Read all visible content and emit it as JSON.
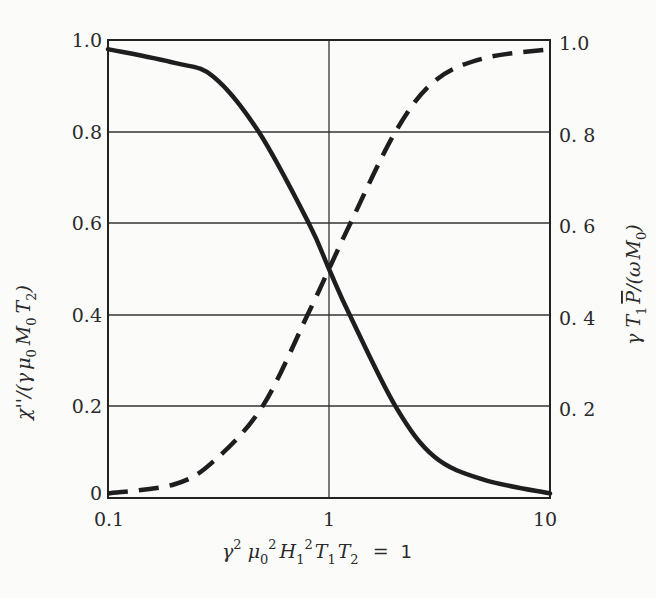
{
  "chart_data": {
    "type": "line",
    "title": "",
    "xscale": "log",
    "xlim": [
      0.1,
      10
    ],
    "ylim": [
      0,
      1.0
    ],
    "grid": true,
    "x_ticks": [
      "0.1",
      "1",
      "10"
    ],
    "y_left_ticks": [
      "0",
      "0.2",
      "0.4",
      "0.6",
      "0.8",
      "1.0"
    ],
    "y_right_ticks": [
      "0.2",
      "0.4",
      "0.6",
      "0.8",
      "1.0"
    ],
    "xlabel": "γ² μ₀² H₁² T₁ T₂ = 1",
    "ylabel_left": "χ''/(γ μ₀ M₀ T₂)",
    "ylabel_right": "γ T₁ P̄/(ω M₀)",
    "series": [
      {
        "name": "χ''/(γ μ0 M0 T2)",
        "style": "solid",
        "axis": "left",
        "x": [
          0.1,
          0.2,
          0.3,
          0.48,
          0.81,
          1.0,
          1.24,
          2.0,
          3.0,
          5.0,
          10.0
        ],
        "values": [
          0.98,
          0.95,
          0.92,
          0.8,
          0.6,
          0.5,
          0.4,
          0.2,
          0.09,
          0.04,
          0.01
        ]
      },
      {
        "name": "γ T1 P̄/(ω M0)",
        "style": "dashed",
        "axis": "right",
        "x": [
          0.1,
          0.2,
          0.3,
          0.5,
          0.8,
          1.0,
          1.25,
          2.0,
          3.0,
          5.0,
          10.0
        ],
        "values": [
          0.01,
          0.03,
          0.08,
          0.2,
          0.4,
          0.5,
          0.6,
          0.8,
          0.91,
          0.96,
          0.98
        ]
      }
    ]
  },
  "axes": {
    "x_ticks": [
      "0.1",
      "1",
      "10"
    ],
    "y_left_ticks": [
      "1.0",
      "0.8",
      "0.6",
      "0.4",
      "0.2",
      "0"
    ],
    "y_right_ticks": [
      "1.0",
      "0. 8",
      "0. 6",
      "0. 4",
      "0. 2"
    ]
  },
  "labels": {
    "xlabel": {
      "gamma": "γ",
      "sup2": "2",
      "mu": "μ",
      "sub0": "0",
      "H": "H",
      "sub1": "1",
      "T": "T",
      "sub2": "2",
      "equals": "=",
      "one": "1"
    },
    "ylabel_left": {
      "chi": "χ''/(γ",
      "mu": "μ",
      "sub0": "0",
      "M": "M",
      "T": "T",
      "sub2": "2",
      "close": ")"
    },
    "ylabel_right": {
      "gammaT": "γ T",
      "sub1": "1",
      "P": "P",
      "slash": "/(ω",
      "M": "M",
      "sub0": "0",
      "close": ")"
    }
  }
}
